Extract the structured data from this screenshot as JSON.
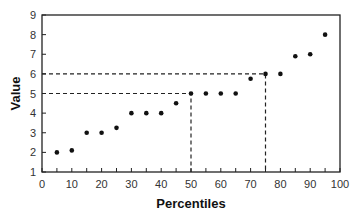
{
  "chart_data": {
    "type": "scatter",
    "title": "",
    "xlabel": "Percentiles",
    "ylabel": "Value",
    "xlim": [
      0,
      100
    ],
    "ylim": [
      1,
      9
    ],
    "x_ticks": [
      0,
      10,
      20,
      30,
      40,
      50,
      60,
      70,
      80,
      90,
      100
    ],
    "y_ticks": [
      1,
      2,
      3,
      4,
      5,
      6,
      7,
      8,
      9
    ],
    "grid": false,
    "legend": null,
    "series": [
      {
        "name": "values",
        "x": [
          5,
          10,
          15,
          20,
          25,
          30,
          35,
          40,
          45,
          50,
          55,
          60,
          65,
          70,
          75,
          80,
          85,
          90,
          95
        ],
        "y": [
          2.0,
          2.1,
          3.0,
          3.0,
          3.25,
          4.0,
          4.0,
          4.0,
          4.5,
          5.0,
          5.0,
          5.0,
          5.0,
          5.75,
          6.0,
          6.0,
          6.9,
          7.0,
          8.0
        ]
      }
    ],
    "annotations": [
      {
        "type": "dashed-guide",
        "x": 50,
        "y": 5,
        "label": "50th percentile = 5"
      },
      {
        "type": "dashed-guide",
        "x": 75,
        "y": 6,
        "label": "75th percentile = 6"
      }
    ]
  }
}
